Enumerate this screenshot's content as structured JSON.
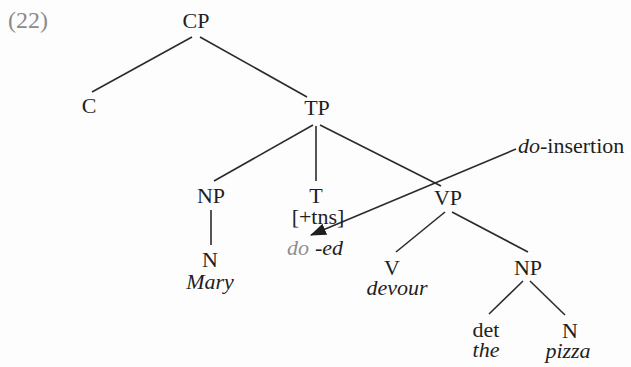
{
  "figure": {
    "example_number": "(22)",
    "tree": {
      "labels": {
        "cp": "CP",
        "c": "C",
        "tp": "TP",
        "np_subject": "NP",
        "t": "T",
        "t_feature": "[+tns]",
        "do_inserted": "do",
        "tense_affix": "-ed",
        "n_subject": "N",
        "subject_word": "Mary",
        "vp": "VP",
        "v": "V",
        "verb_word": "devour",
        "np_object": "NP",
        "det": "det",
        "det_word": "the",
        "n_object": "N",
        "object_word": "pizza"
      },
      "structure": {
        "edges": [
          {
            "from": "CP",
            "to": "C"
          },
          {
            "from": "CP",
            "to": "TP"
          },
          {
            "from": "TP",
            "to": "NP-subject"
          },
          {
            "from": "TP",
            "to": "T"
          },
          {
            "from": "TP",
            "to": "VP"
          },
          {
            "from": "NP-subject",
            "to": "N"
          },
          {
            "from": "VP",
            "to": "V"
          },
          {
            "from": "VP",
            "to": "NP-object"
          },
          {
            "from": "NP-object",
            "to": "det"
          },
          {
            "from": "NP-object",
            "to": "N"
          }
        ],
        "arrow": {
          "from": "do-insertion annotation",
          "to": "do (under T [+tns])"
        }
      }
    },
    "annotation": {
      "do_italic": "do",
      "insertion_text": "-insertion"
    },
    "colors": {
      "text": "#1f1f1f",
      "example_number_gray": "#8b8b8b",
      "inserted_do_gray": "#8f8f8f",
      "line": "#2b2b2b"
    }
  }
}
